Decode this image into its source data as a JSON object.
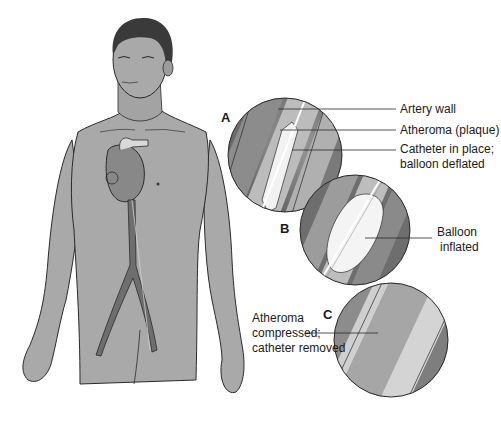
{
  "figure": {
    "colors": {
      "skin": "#a9a9a9",
      "outline": "#2a2a2a",
      "hair": "#3a3a3a",
      "artery_dark": "#6e6e6e",
      "artery_mid": "#8c8c8c",
      "plaque": "#b9b9b9",
      "lumen_light": "#d8d8d8",
      "balloon": "#f2f2f2"
    },
    "panels": [
      {
        "letter": "A",
        "description": "Catheter inserted, balloon deflated"
      },
      {
        "letter": "B",
        "description": "Balloon inflated"
      },
      {
        "letter": "C",
        "description": "Atheroma compressed, catheter removed"
      }
    ],
    "labels": {
      "artery_wall": "Artery wall",
      "atheroma": "Atheroma (plaque)",
      "catheter_line1": "Catheter in place;",
      "catheter_line2": "balloon deflated",
      "balloon_line1": "Balloon",
      "balloon_line2": "inflated",
      "compressed_line1": "Atheroma",
      "compressed_line2": "compressed;",
      "compressed_line3": "catheter removed"
    }
  }
}
